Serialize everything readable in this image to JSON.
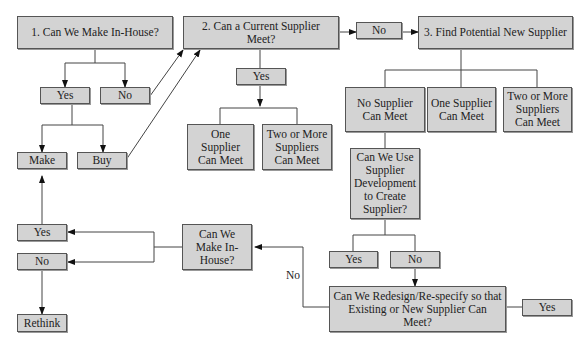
{
  "diagram": {
    "nodes": {
      "q1": "1. Can We Make In-House?",
      "q1_yes": "Yes",
      "q1_no": "No",
      "make": "Make",
      "buy": "Buy",
      "q2": "2. Can a Current Supplier Meet?",
      "q2_yes": "Yes",
      "q2_no": "No",
      "q2_one": "One Supplier Can Meet",
      "q2_two": "Two or More Suppliers Can Meet",
      "q3": "3. Find Potential New Supplier",
      "q3_none": "No Supplier Can Meet",
      "q3_one": "One Supplier Can Meet",
      "q3_two": "Two or More Suppliers Can Meet",
      "dev": "Can We Use Supplier Development to Create Supplier?",
      "dev_yes": "Yes",
      "dev_no": "No",
      "redesign": "Can We Redesign/Re-specify so that Existing or New Supplier Can Meet?",
      "redesign_yes": "Yes",
      "make2": "Can We Make In-House?",
      "make2_yes": "Yes",
      "make2_no": "No",
      "rethink": "Rethink"
    },
    "edge_labels": {
      "redesign_no": "No"
    }
  }
}
